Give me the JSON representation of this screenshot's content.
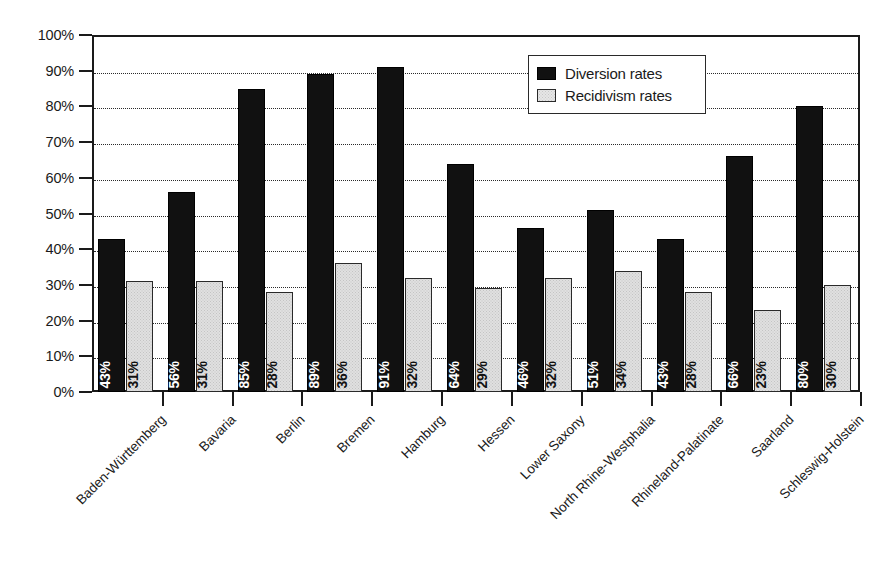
{
  "chart_data": {
    "type": "bar",
    "title": "",
    "subtitle": "",
    "xlabel": "",
    "ylabel": "",
    "ylim": [
      0,
      100
    ],
    "ytick_labels": [
      "0%",
      "10%",
      "20%",
      "30%",
      "40%",
      "50%",
      "60%",
      "70%",
      "80%",
      "90%",
      "100%"
    ],
    "ytick_values": [
      0,
      10,
      20,
      30,
      40,
      50,
      60,
      70,
      80,
      90,
      100
    ],
    "grid": "horizontal-dotted",
    "legend_position": "top-right-inside",
    "value_label_format": "percent",
    "value_label_rotation": 90,
    "categories": [
      "Baden-Württemberg",
      "Bavaria",
      "Berlin",
      "Bremen",
      "Hamburg",
      "Hessen",
      "Lower Saxony",
      "North Rhine-Westphalia",
      "Rhineland-Palatinate",
      "Saarland",
      "Schleswig-Holstein"
    ],
    "series": [
      {
        "name": "Diversion rates",
        "color": "#111111",
        "values": [
          43,
          56,
          85,
          89,
          91,
          64,
          46,
          51,
          43,
          66,
          80
        ],
        "labels": [
          "43%",
          "56%",
          "85%",
          "89%",
          "91%",
          "64%",
          "46%",
          "51%",
          "43%",
          "66%",
          "80%"
        ]
      },
      {
        "name": "Recidivism rates",
        "color": "#e0e0e0",
        "values": [
          31,
          31,
          28,
          36,
          32,
          29,
          32,
          34,
          28,
          23,
          30
        ],
        "labels": [
          "31%",
          "31%",
          "28%",
          "36%",
          "32%",
          "29%",
          "32%",
          "34%",
          "28%",
          "23%",
          "30%"
        ]
      }
    ]
  },
  "legend": {
    "items": [
      {
        "label": "Diversion rates",
        "swatch": "diversion"
      },
      {
        "label": "Recidivism rates",
        "swatch": "recidivism"
      }
    ]
  },
  "colors": {
    "diversion_bar": "#111111",
    "recidivism_bar": "#e0e0e0",
    "axis": "#1a1a1a",
    "gridline": "#2b2b2b",
    "background": "#ffffff"
  }
}
